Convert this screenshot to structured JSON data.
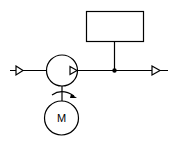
{
  "diagram": {
    "type": "pump-schematic",
    "components": {
      "inlet": {
        "symbol": "flow-arrow"
      },
      "pump": {
        "symbol": "pump-circle-with-discharge-triangle"
      },
      "motor": {
        "label": "M"
      },
      "coupling": {
        "symbol": "rotation-arrow"
      },
      "junction": {
        "symbol": "dot"
      },
      "instrument_box": {
        "label": ""
      },
      "outlet": {
        "symbol": "flow-arrow"
      }
    },
    "colors": {
      "stroke": "#000000",
      "background": "#ffffff"
    }
  }
}
